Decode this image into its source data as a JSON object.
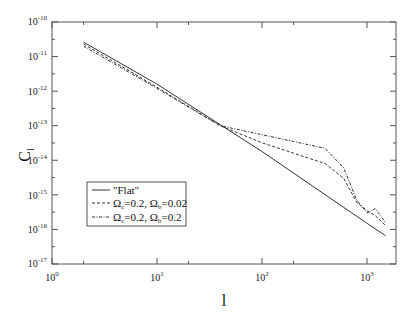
{
  "chart_data": {
    "type": "line",
    "title": "",
    "xlabel": "l",
    "ylabel": "C_l",
    "xscale": "log",
    "yscale": "log",
    "xlim": [
      1,
      2000
    ],
    "ylim": [
      1e-17,
      1e-10
    ],
    "x_ticks": [
      "10^0",
      "10^1",
      "10^2",
      "10^3"
    ],
    "y_ticks": [
      "10^-10",
      "10^-11",
      "10^-12",
      "10^-13",
      "10^-14",
      "10^-15",
      "10^-16",
      "10^-17"
    ],
    "grid": false,
    "legend_position": "lower-left",
    "series": [
      {
        "name": "\"Flat\"",
        "style": "solid",
        "x": [
          2,
          10,
          100,
          1000,
          1500
        ],
        "y": [
          2.6e-11,
          1.6e-12,
          1.8e-14,
          1.5e-16,
          6.6e-17
        ]
      },
      {
        "name": "Ω_c=0.2, Ω_b=0.02",
        "style": "dashed",
        "x": [
          2,
          10,
          40,
          100,
          200,
          400,
          600,
          800,
          1000,
          1200,
          1500
        ],
        "y": [
          2.3e-11,
          1.3e-12,
          1e-13,
          3.2e-14,
          1.6e-14,
          8e-15,
          3e-15,
          6e-16,
          3.5e-16,
          2.5e-16,
          1.3e-16
        ]
      },
      {
        "name": "Ω_c=0.2, Ω_b=0.2",
        "style": "dash-dot",
        "x": [
          2,
          10,
          40,
          100,
          200,
          400,
          600,
          800,
          1000,
          1200,
          1500
        ],
        "y": [
          2e-11,
          1.2e-12,
          1e-13,
          5.5e-14,
          3.5e-14,
          2.2e-14,
          6e-15,
          7e-16,
          3e-16,
          4e-16,
          1.6e-16
        ]
      }
    ]
  },
  "axes": {
    "xlabel": "l",
    "ylabel_main": "C",
    "ylabel_sub": "l",
    "x_tick_labels": [
      {
        "base": "10",
        "exp": "0"
      },
      {
        "base": "10",
        "exp": "1"
      },
      {
        "base": "10",
        "exp": "2"
      },
      {
        "base": "10",
        "exp": "3"
      }
    ],
    "y_tick_labels": [
      {
        "base": "10",
        "exp": "-10"
      },
      {
        "base": "10",
        "exp": "-11"
      },
      {
        "base": "10",
        "exp": "-12"
      },
      {
        "base": "10",
        "exp": "-13"
      },
      {
        "base": "10",
        "exp": "-14"
      },
      {
        "base": "10",
        "exp": "-15"
      },
      {
        "base": "10",
        "exp": "-16"
      },
      {
        "base": "10",
        "exp": "-17"
      }
    ]
  },
  "legend": {
    "items": [
      {
        "label": "\"Flat\""
      },
      {
        "omega": "Ω",
        "c_sub": "c",
        "c_val": "=0.2, ",
        "b_sub": "b",
        "b_val": "=0.02"
      },
      {
        "omega": "Ω",
        "c_sub": "c",
        "c_val": "=0.2, ",
        "b_sub": "b",
        "b_val": "=0.2"
      }
    ]
  },
  "colors": {
    "axis": "#555555",
    "series": "#333333"
  }
}
